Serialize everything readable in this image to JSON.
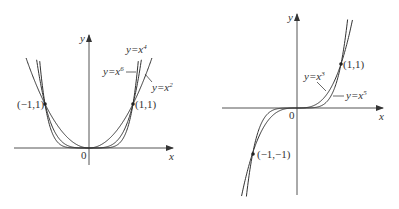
{
  "left_graph": {
    "title": "Even power functions",
    "axis_x_label": "x",
    "axis_y_label": "y",
    "origin_label": "0",
    "points": [
      {
        "label": "(−1,1)",
        "x": -1,
        "y": 1
      },
      {
        "label": "(1,1)",
        "x": 1,
        "y": 1
      }
    ],
    "curves": [
      {
        "name": "y=x2",
        "label_base": "y=x",
        "exponent": "2",
        "power": 2
      },
      {
        "name": "y=x4",
        "label_base": "y=x",
        "exponent": "4",
        "power": 4
      },
      {
        "name": "y=x6",
        "label_base": "y=x",
        "exponent": "6",
        "power": 6
      }
    ]
  },
  "right_graph": {
    "title": "Odd power functions",
    "axis_x_label": "x",
    "axis_y_label": "y",
    "origin_label": "0",
    "points": [
      {
        "label": "(1,1)",
        "x": 1,
        "y": 1
      },
      {
        "label": "(−1,−1)",
        "x": -1,
        "y": -1
      }
    ],
    "curves": [
      {
        "name": "y=x3",
        "label_base": "y=x",
        "exponent": "3",
        "power": 3
      },
      {
        "name": "y=x5",
        "label_base": "y=x",
        "exponent": "5",
        "power": 5
      }
    ]
  },
  "colors": {
    "axis": "#555555",
    "curve": "#333333",
    "text": "#333333"
  }
}
